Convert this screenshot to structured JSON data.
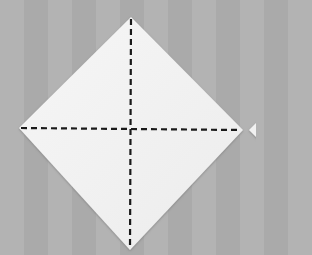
{
  "diagram": {
    "type": "origami-step",
    "colors": {
      "background": "#b0b0b0",
      "paper": "#f3f3f3",
      "paper_shadow": "#8a8a8a",
      "fold_line": "#1a1a1a"
    },
    "paper_corners": {
      "top": [
        131,
        17
      ],
      "right": [
        243,
        130
      ],
      "bottom": [
        130,
        250
      ],
      "left": [
        19,
        128
      ]
    },
    "fold_lines": [
      {
        "name": "vertical-diagonal",
        "from": [
          131,
          17
        ],
        "to": [
          130,
          250
        ],
        "style": "dashed"
      },
      {
        "name": "horizontal-diagonal",
        "from": [
          19,
          128
        ],
        "to": [
          243,
          130
        ],
        "style": "dashed"
      }
    ],
    "next_step_partial": {
      "visible_tip": [
        249,
        130
      ]
    }
  }
}
